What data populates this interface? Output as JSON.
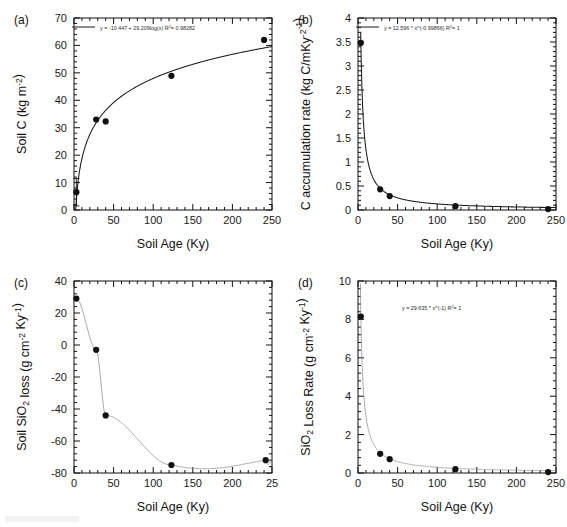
{
  "figure": {
    "background": "#ffffff",
    "marker_color": "#111111",
    "fit_color": "#1a1a1a",
    "fit_color_thin": "#8c8c8c"
  },
  "panels": [
    {
      "id": "a",
      "label": "(a)",
      "chart_data": {
        "type": "scatter",
        "title": "",
        "xlabel": "Soil Age (Ky)",
        "ylabel": "Soil C (kg m-2)",
        "ylabel_parts": {
          "base": "Soil C (kg m",
          "sup": "-2",
          "tail": ")"
        },
        "xlim": [
          0,
          250
        ],
        "ylim": [
          0,
          70
        ],
        "xticks": [
          0,
          50,
          100,
          150,
          200,
          250
        ],
        "yticks": [
          0,
          10,
          20,
          30,
          40,
          50,
          60,
          70
        ],
        "xminor_count": 5,
        "yminor_count": 5,
        "grid": false,
        "legend": "inside-top",
        "equation": "y = -10.447 + 29.209log(x)",
        "r2_label": "R",
        "r2_sup": "2",
        "r2_value": "= 0.98282",
        "fit_type": "log",
        "fit_params": {
          "a": -10.447,
          "b": 29.209
        },
        "series": [
          {
            "name": "Soil C",
            "x": [
              3,
              28,
              40,
              123,
              240
            ],
            "y": [
              6.5,
              33.0,
              32.3,
              48.9,
              62.0
            ],
            "yerr": [
              5.0,
              0,
              0,
              0,
              0
            ]
          }
        ]
      }
    },
    {
      "id": "b",
      "label": "(b)",
      "chart_data": {
        "type": "scatter",
        "title": "",
        "xlabel": "Soil Age (Ky)",
        "ylabel": "C accumulation rate (kg C/m-2Ky-1)",
        "ylabel_parts": {
          "base": "C accumulation rate (kg C/m",
          "sup": "-2",
          "mid": "Ky",
          "sup2": "-1",
          "tail": ")"
        },
        "xlim": [
          0,
          250
        ],
        "ylim": [
          0,
          4
        ],
        "xticks": [
          0,
          50,
          100,
          150,
          200,
          250
        ],
        "yticks": [
          0,
          0.5,
          1,
          1.5,
          2,
          2.5,
          3,
          3.5,
          4
        ],
        "ytick_labels": [
          "0",
          "0.5",
          "1",
          "1.5",
          "2",
          "2.5",
          "3",
          "3.5",
          "4"
        ],
        "xminor_count": 5,
        "yminor_count": 5,
        "grid": false,
        "legend": "inside-top",
        "equation": "y = 12.596 * x^(-0.99866)",
        "r2_label": "R",
        "r2_sup": "2",
        "r2_value": "= 1",
        "fit_type": "power",
        "fit_params": {
          "a": 12.596,
          "b": -0.99866
        },
        "series": [
          {
            "name": "C accumulation rate",
            "x": [
              3.5,
              28,
              40,
              123,
              240
            ],
            "y": [
              3.48,
              0.43,
              0.29,
              0.08,
              0.02
            ],
            "yerr": [
              0,
              0,
              0,
              0,
              0
            ]
          }
        ]
      }
    },
    {
      "id": "c",
      "label": "(c)",
      "chart_data": {
        "type": "scatter",
        "title": "",
        "xlabel": "Soil Age (Ky)",
        "ylabel": "Soil SiO2 loss (g cm-2 Ky-1)",
        "ylabel_parts": {
          "base": "Soil SiO",
          "sub": "2",
          "mid": " loss (g cm",
          "sup": "-2",
          "mid2": " Ky",
          "sup2": "-1",
          "tail": ")"
        },
        "xlim": [
          0,
          250
        ],
        "ylim": [
          -80,
          40
        ],
        "xticks": [
          0,
          50,
          100,
          150,
          200,
          250
        ],
        "xtick_labels": [
          "0",
          "50",
          "100",
          "150",
          "200",
          "25"
        ],
        "yticks": [
          -80,
          -60,
          -40,
          -20,
          0,
          20,
          40
        ],
        "ytick_labels": [
          "-80",
          "-60",
          "-40",
          "-20",
          "0",
          "20",
          "40"
        ],
        "xminor_count": 5,
        "yminor_count": 5,
        "grid": false,
        "legend": "none",
        "equation": "",
        "fit_type": "spline",
        "series": [
          {
            "name": "Soil SiO2 loss",
            "x": [
              3,
              28,
              40,
              123,
              242
            ],
            "y": [
              29.0,
              -3.0,
              -44.0,
              -75.0,
              -72.0
            ],
            "yerr": [
              0,
              0,
              0,
              0,
              0
            ]
          }
        ]
      }
    },
    {
      "id": "d",
      "label": "(d)",
      "chart_data": {
        "type": "scatter",
        "title": "",
        "xlabel": "Soil Age (Ky)",
        "ylabel": "SiO2 Loss Rate (g cm-2 Ky-1)",
        "ylabel_parts": {
          "base": "SiO",
          "sub": "2",
          "mid": " Loss Rate (g cm",
          "sup": "-2",
          "mid2": " Ky",
          "sup2": "-1",
          "tail": ")"
        },
        "xlim": [
          0,
          250
        ],
        "ylim": [
          0,
          10
        ],
        "xticks": [
          0,
          50,
          100,
          150,
          200,
          250
        ],
        "yticks": [
          0,
          2,
          4,
          6,
          8,
          10
        ],
        "xminor_count": 5,
        "yminor_count": 5,
        "grid": false,
        "legend": "annotation",
        "equation": "y = 29.635 * x^(-1)",
        "r2_label": "R",
        "r2_sup": "2",
        "r2_value": "= 1",
        "fit_type": "power",
        "fit_params": {
          "a": 29.635,
          "b": -1
        },
        "series": [
          {
            "name": "SiO2 Loss Rate",
            "x": [
              3.6,
              28,
              40,
              123,
              240
            ],
            "y": [
              8.15,
              1.0,
              0.72,
              0.2,
              0.05
            ],
            "yerr": [
              0,
              0,
              0,
              0,
              0
            ]
          }
        ]
      }
    }
  ]
}
